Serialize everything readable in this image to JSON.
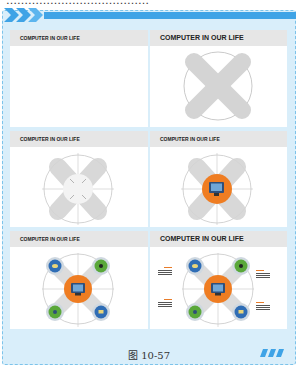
{
  "page": {
    "top_text_fragment": "…………………………………",
    "caption": "图 10-57",
    "colors": {
      "frame_bg": "#d9eefa",
      "frame_border": "#7cc3ea",
      "accent_blue": "#3fa3e6",
      "title_bar": "#e6e6e6",
      "x_shape_gray": "#d4d4d4",
      "center_orange": "#ef7d22",
      "icon_blue": "#2f6db5",
      "icon_green": "#5aa83a"
    }
  },
  "slides": [
    {
      "title": "COMPUTER IN OUR LIFE",
      "step": 1,
      "description": "empty slide with title"
    },
    {
      "title": "COMPUTER IN OUR LIFE",
      "step": 2,
      "description": "gray X shape over circle outline"
    },
    {
      "title": "COMPUTER IN OUR LIFE",
      "step": 3,
      "description": "X shape with crosshair lines and white center circle"
    },
    {
      "title": "COMPUTER IN OUR LIFE",
      "step": 4,
      "description": "orange center circle with computer monitor icon"
    },
    {
      "title": "COMPUTER IN OUR LIFE",
      "step": 5,
      "description": "four circular icons at X ends (blue, green, green, blue)"
    },
    {
      "title": "COMPUTER IN OUR LIFE",
      "step": 6,
      "description": "final slide with icons and text labels",
      "labels": [
        {
          "heading": "Lorem",
          "body": "Changing is on the run in is the out our gravitation"
        },
        {
          "heading": "Lorem",
          "body": "Changing is on the run in is the out our gravitation"
        },
        {
          "heading": "Lorem",
          "body": "Changing is on the run in is the out our gravitation"
        },
        {
          "heading": "Lorem",
          "body": "Changing is on the run in is the out our gravitation"
        }
      ]
    }
  ]
}
